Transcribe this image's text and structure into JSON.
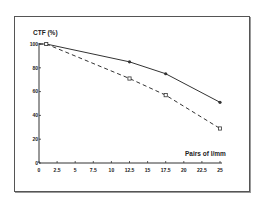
{
  "chart_data": {
    "type": "line",
    "title": "",
    "ylabel": "CTF (%)",
    "xlabel": "Pairs of l/mm",
    "xlim": [
      0,
      25
    ],
    "ylim": [
      0,
      100
    ],
    "x_ticks": [
      "0",
      "2.5",
      "5",
      "7.5",
      "10",
      "12.5",
      "15",
      "17.5",
      "20",
      "22.5",
      "25"
    ],
    "y_ticks": [
      "0",
      "20",
      "40",
      "60",
      "80",
      "100"
    ],
    "grid": false,
    "legend": null,
    "series": [
      {
        "name": "solid",
        "style": "solid",
        "marker": "filled-dot",
        "x": [
          1,
          12.5,
          17.5,
          25
        ],
        "y": [
          100,
          85,
          75,
          51
        ]
      },
      {
        "name": "dashed",
        "style": "dashed",
        "marker": "open-square",
        "x": [
          1,
          12.5,
          17.5,
          25
        ],
        "y": [
          100,
          71,
          57,
          29
        ]
      }
    ]
  },
  "colors": {
    "line": "#333333",
    "frame": "#555555",
    "background": "#ffffff"
  }
}
